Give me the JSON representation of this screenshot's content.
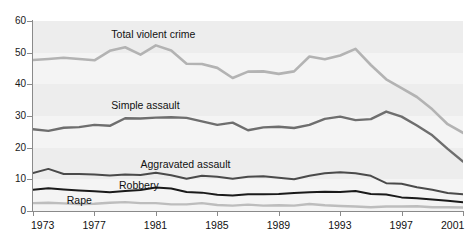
{
  "title_sliver": "",
  "chart_data": {
    "type": "line",
    "title": "",
    "xlabel": "",
    "ylabel": "",
    "xlim": [
      1973,
      2001
    ],
    "ylim": [
      0,
      60
    ],
    "y_ticks": [
      0,
      10,
      20,
      30,
      40,
      50,
      60
    ],
    "x_ticks": [
      1973,
      1977,
      1981,
      1985,
      1989,
      1993,
      1997,
      2001
    ],
    "x": [
      1973,
      1974,
      1975,
      1976,
      1977,
      1978,
      1979,
      1980,
      1981,
      1982,
      1983,
      1984,
      1985,
      1986,
      1987,
      1988,
      1989,
      1990,
      1991,
      1992,
      1993,
      1994,
      1995,
      1996,
      1997,
      1998,
      1999,
      2000,
      2001
    ],
    "grid": "horizontal-bands",
    "legend": "inline-labels",
    "series": [
      {
        "name": "Total violent crime",
        "color": "#b3b3b3",
        "width": 2.6,
        "label_x": 1978.1,
        "label_y": 56.0,
        "values": [
          47.7,
          48.0,
          48.4,
          48.0,
          47.6,
          50.6,
          51.7,
          49.4,
          52.3,
          50.7,
          46.5,
          46.4,
          45.2,
          42.0,
          44.0,
          44.1,
          43.3,
          44.1,
          48.8,
          47.9,
          49.1,
          51.2,
          46.1,
          41.6,
          38.8,
          36.0,
          32.1,
          27.4,
          24.7
        ]
      },
      {
        "name": "Simple assault",
        "color": "#6e6e6e",
        "width": 2.4,
        "label_x": 1978.1,
        "label_y": 33.5,
        "values": [
          25.8,
          25.3,
          26.3,
          26.5,
          27.2,
          26.9,
          29.3,
          29.2,
          29.5,
          29.6,
          29.4,
          28.3,
          27.2,
          27.9,
          25.5,
          26.4,
          26.6,
          26.2,
          27.2,
          29.1,
          29.8,
          28.7,
          29.0,
          31.4,
          29.8,
          27.0,
          23.9,
          19.6,
          15.6
        ]
      },
      {
        "name": "Aggravated assault",
        "color": "#4a4a4a",
        "width": 2.0,
        "label_x": 1980.0,
        "label_y": 15.0,
        "values": [
          12.0,
          13.3,
          11.7,
          11.7,
          11.5,
          11.2,
          11.5,
          11.4,
          12.1,
          11.3,
          10.2,
          11.1,
          10.8,
          10.2,
          10.8,
          11.0,
          10.5,
          10.0,
          11.1,
          11.9,
          12.2,
          11.9,
          11.1,
          8.8,
          8.6,
          7.5,
          6.7,
          5.7,
          5.3
        ]
      },
      {
        "name": "Robbery",
        "color": "#1a1a1a",
        "width": 2.0,
        "label_x": 1978.6,
        "label_y": 8.2,
        "values": [
          6.7,
          7.2,
          6.8,
          6.5,
          6.2,
          5.9,
          6.3,
          6.6,
          7.4,
          7.1,
          6.0,
          5.8,
          5.1,
          4.9,
          5.3,
          5.3,
          5.4,
          5.7,
          5.9,
          6.1,
          6.0,
          6.3,
          5.4,
          5.2,
          4.3,
          4.0,
          3.6,
          3.2,
          2.8
        ]
      },
      {
        "name": "Rape",
        "color": "#bdbdbd",
        "width": 2.4,
        "label_x": 1975.2,
        "label_y": 3.4,
        "values": [
          2.5,
          2.6,
          2.4,
          2.2,
          2.3,
          2.6,
          2.8,
          2.5,
          2.5,
          2.1,
          2.1,
          2.5,
          1.9,
          1.7,
          2.0,
          1.7,
          1.8,
          1.7,
          2.2,
          1.8,
          1.6,
          1.4,
          1.2,
          1.4,
          1.4,
          1.5,
          1.2,
          1.2,
          1.1
        ]
      }
    ]
  }
}
